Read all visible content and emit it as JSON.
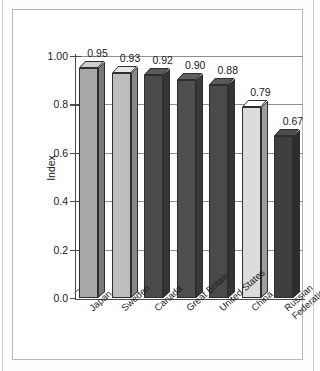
{
  "chart_data": {
    "type": "bar",
    "title": "",
    "subtitle": "",
    "xlabel": "",
    "ylabel": "Index",
    "categories": [
      "Japan",
      "Sweden",
      "Canada",
      "Great Britain",
      "United States",
      "China",
      "Russian Federation"
    ],
    "category_lines": [
      [
        "Japan"
      ],
      [
        "Sweden"
      ],
      [
        "Canada"
      ],
      [
        "Great Britain"
      ],
      [
        "United States"
      ],
      [
        "China"
      ],
      [
        "Russian",
        "Federation"
      ]
    ],
    "values": [
      0.95,
      0.93,
      0.92,
      0.9,
      0.88,
      0.79,
      0.67
    ],
    "value_labels": [
      "0.95",
      "0.93",
      "0.92",
      "0.90",
      "0.88",
      "0.79",
      "0.67"
    ],
    "bar_colors": [
      "#a8a8a8",
      "#bdbdbd",
      "#4a4a4a",
      "#4f4f4f",
      "#4a4a4a",
      "#dcdcdc",
      "#3f3f3f"
    ],
    "ylim": [
      0.0,
      1.0
    ],
    "yticks": [
      0.0,
      0.2,
      0.4,
      0.6,
      0.8,
      1.0
    ],
    "ytick_labels": [
      "0.0",
      "0.2",
      "0.4",
      "0.6",
      "0.8",
      "1.00"
    ],
    "grid": true,
    "grid_axis": "y",
    "legend": false,
    "legend_position": "none",
    "style": "3d-column",
    "annotations": []
  },
  "colors": {
    "axis": "#4a4a4a",
    "grid": "#8f8f8f",
    "text": "#1a1a1a",
    "panel_bg": "#ffffff",
    "panel_border": "#b9b9b9",
    "figure_bg": "#fdfdfd",
    "bar_outline": "#2e2e2e"
  }
}
